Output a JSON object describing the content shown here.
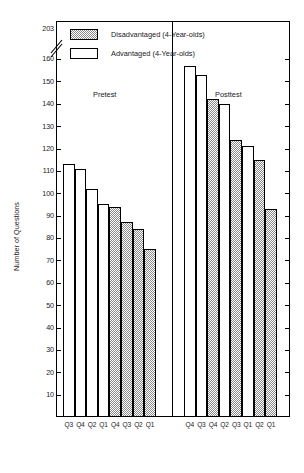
{
  "chart_data": {
    "type": "bar",
    "title": "",
    "xlabel": "",
    "ylabel": "Number of Questions",
    "ylim": [
      0,
      165
    ],
    "y_ticks": [
      10,
      20,
      30,
      40,
      50,
      60,
      70,
      80,
      90,
      100,
      110,
      120,
      130,
      140,
      150,
      160
    ],
    "y_top_broken_tick": 203,
    "axis_break": true,
    "grid": false,
    "legend_position": "top-left",
    "groups": [
      {
        "name": "Pretest",
        "categories": [
          "Q3",
          "Q4",
          "Q2",
          "Q1",
          "Q4",
          "Q3",
          "Q2",
          "Q1"
        ],
        "series_of_bar": [
          "Advantaged",
          "Advantaged",
          "Advantaged",
          "Advantaged",
          "Disadvantaged",
          "Disadvantaged",
          "Disadvantaged",
          "Disadvantaged"
        ],
        "values": [
          113,
          111,
          102,
          95,
          94,
          87,
          84,
          75
        ]
      },
      {
        "name": "Posttest",
        "categories": [
          "Q4",
          "Q3",
          "Q4",
          "Q2",
          "Q3",
          "Q1",
          "Q2",
          "Q1"
        ],
        "series_of_bar": [
          "Advantaged",
          "Advantaged",
          "Disadvantaged",
          "Advantaged",
          "Disadvantaged",
          "Advantaged",
          "Disadvantaged",
          "Disadvantaged"
        ],
        "values": [
          157,
          153,
          142,
          140,
          124,
          121,
          115,
          93
        ]
      }
    ],
    "series": [
      {
        "name": "Disadvantaged (4-Year-olds)",
        "fill": "stipple"
      },
      {
        "name": "Advantaged (4-Year-olds)",
        "fill": "white"
      }
    ]
  },
  "legend": {
    "items": [
      {
        "label": "Disadvantaged (4-Year-olds)",
        "fill": "stipple"
      },
      {
        "label": "Advantaged (4-Year-olds)",
        "fill": "white"
      }
    ]
  },
  "axis": {
    "y_title": "Number of Questions",
    "y_ticks": [
      "203",
      "160",
      "150",
      "140",
      "130",
      "120",
      "110",
      "100",
      "90",
      "80",
      "70",
      "60",
      "50",
      "40",
      "30",
      "20",
      "10"
    ]
  },
  "groups": {
    "pretest_label": "Pretest",
    "posttest_label": "Posttest"
  },
  "x_labels": [
    "Q3",
    "Q4",
    "Q2",
    "Q1",
    "Q4",
    "Q3",
    "Q2",
    "Q1",
    "Q4",
    "Q3",
    "Q4",
    "Q2",
    "Q3",
    "Q1",
    "Q2",
    "Q1"
  ],
  "colors": {
    "axis": "#000000",
    "bar_outline": "#000000",
    "stipple": "#8a8a8a",
    "background": "#ffffff"
  }
}
